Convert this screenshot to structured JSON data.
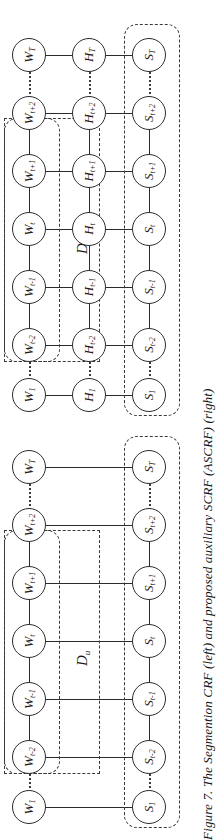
{
  "figure": {
    "caption": "Figure 7. The Segmention CRF (left) and proposed auxiliary SCRF (ASCRF) (right)",
    "caption_label": "Figure 7.",
    "rotation_degrees": -90,
    "page_width": 218,
    "page_height": 840,
    "ink_color": "#2b2b2b",
    "dash_color": "#3a3a3a",
    "background": "#ffffff"
  },
  "diagrams": [
    {
      "id": "scrf",
      "name": "Segmention CRF",
      "position": "left",
      "group_label": {
        "base": "D",
        "sub": "u"
      },
      "rows": [
        {
          "key": "first",
          "w": {
            "base": "W",
            "sub": "1"
          },
          "s": {
            "base": "S",
            "sub": "1"
          }
        },
        {
          "key": "tm2",
          "w": {
            "base": "W",
            "sub": "t-2"
          },
          "s": {
            "base": "S",
            "sub": "t-2"
          }
        },
        {
          "key": "tm1",
          "w": {
            "base": "W",
            "sub": "t-1"
          },
          "s": {
            "base": "S",
            "sub": "t-1"
          }
        },
        {
          "key": "t",
          "w": {
            "base": "W",
            "sub": "t"
          },
          "s": {
            "base": "S",
            "sub": "t"
          }
        },
        {
          "key": "tp1",
          "w": {
            "base": "W",
            "sub": "t+1"
          },
          "s": {
            "base": "S",
            "sub": "t+1"
          }
        },
        {
          "key": "tp2",
          "w": {
            "base": "W",
            "sub": "t+2"
          },
          "s": {
            "base": "S",
            "sub": "t+2"
          }
        },
        {
          "key": "last",
          "w": {
            "base": "W",
            "sub": "T"
          },
          "s": {
            "base": "S",
            "sub": "T"
          }
        }
      ],
      "layers": [
        "W",
        "S"
      ],
      "has_hidden_layer": false
    },
    {
      "id": "ascrf",
      "name": "auxiliary SCRF (ASCRF)",
      "position": "right",
      "group_label": {
        "base": "D",
        "sub": "u"
      },
      "rows": [
        {
          "key": "first",
          "w": {
            "base": "W",
            "sub": "1"
          },
          "h": {
            "base": "H",
            "sub": "1"
          },
          "s": {
            "base": "S",
            "sub": "1"
          }
        },
        {
          "key": "tm2",
          "w": {
            "base": "W",
            "sub": "t-2"
          },
          "h": {
            "base": "H",
            "sub": "t-2"
          },
          "s": {
            "base": "S",
            "sub": "t-2"
          }
        },
        {
          "key": "tm1",
          "w": {
            "base": "W",
            "sub": "t-1"
          },
          "h": {
            "base": "H",
            "sub": "t-1"
          },
          "s": {
            "base": "S",
            "sub": "t-1"
          }
        },
        {
          "key": "t",
          "w": {
            "base": "W",
            "sub": "t"
          },
          "h": {
            "base": "H",
            "sub": "t"
          },
          "s": {
            "base": "S",
            "sub": "t"
          }
        },
        {
          "key": "tp1",
          "w": {
            "base": "W",
            "sub": "t+1"
          },
          "h": {
            "base": "H",
            "sub": "t+1"
          },
          "s": {
            "base": "S",
            "sub": "t+1"
          }
        },
        {
          "key": "tp2",
          "w": {
            "base": "W",
            "sub": "t+2"
          },
          "h": {
            "base": "H",
            "sub": "t+2"
          },
          "s": {
            "base": "S",
            "sub": "t+2"
          }
        },
        {
          "key": "last",
          "w": {
            "base": "W",
            "sub": "T"
          },
          "h": {
            "base": "H",
            "sub": "T"
          },
          "s": {
            "base": "S",
            "sub": "T"
          }
        }
      ],
      "layers": [
        "W",
        "H",
        "S"
      ],
      "has_hidden_layer": true
    }
  ]
}
